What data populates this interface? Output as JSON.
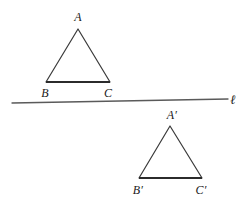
{
  "figure": {
    "background_color": "#ffffff",
    "stroke_color": "#3a3a3a",
    "base_stroke_color": "#2b2b2b",
    "line_color": "#5a5a5a",
    "label_color": "#1a1a1a",
    "width": 248,
    "height": 202
  },
  "mirror_line": {
    "label": "ℓ",
    "label_x": 233,
    "label_y": 99,
    "x1": 12,
    "y1": 103,
    "x2": 228,
    "y2": 99,
    "stroke_width": 1.3
  },
  "triangles": [
    {
      "name": "pre-image",
      "vertices": [
        {
          "label": "A",
          "x": 78,
          "y": 29,
          "label_x": 78,
          "label_y": 17
        },
        {
          "label": "B",
          "x": 46,
          "y": 82,
          "label_x": 45,
          "label_y": 93
        },
        {
          "label": "C",
          "x": 110,
          "y": 82,
          "label_x": 108,
          "label_y": 93
        }
      ],
      "points": "78,29 46,82 110,82",
      "base": {
        "x1": 46,
        "y1": 82,
        "x2": 110,
        "y2": 82
      }
    },
    {
      "name": "image",
      "vertices": [
        {
          "label": "A′",
          "x": 170,
          "y": 126,
          "label_x": 172,
          "label_y": 115
        },
        {
          "label": "B′",
          "x": 139,
          "y": 178,
          "label_x": 138,
          "label_y": 190
        },
        {
          "label": "C′",
          "x": 202,
          "y": 178,
          "label_x": 201,
          "label_y": 190
        }
      ],
      "points": "170,126 139,178 202,178",
      "base": {
        "x1": 139,
        "y1": 178,
        "x2": 202,
        "y2": 178
      }
    }
  ]
}
